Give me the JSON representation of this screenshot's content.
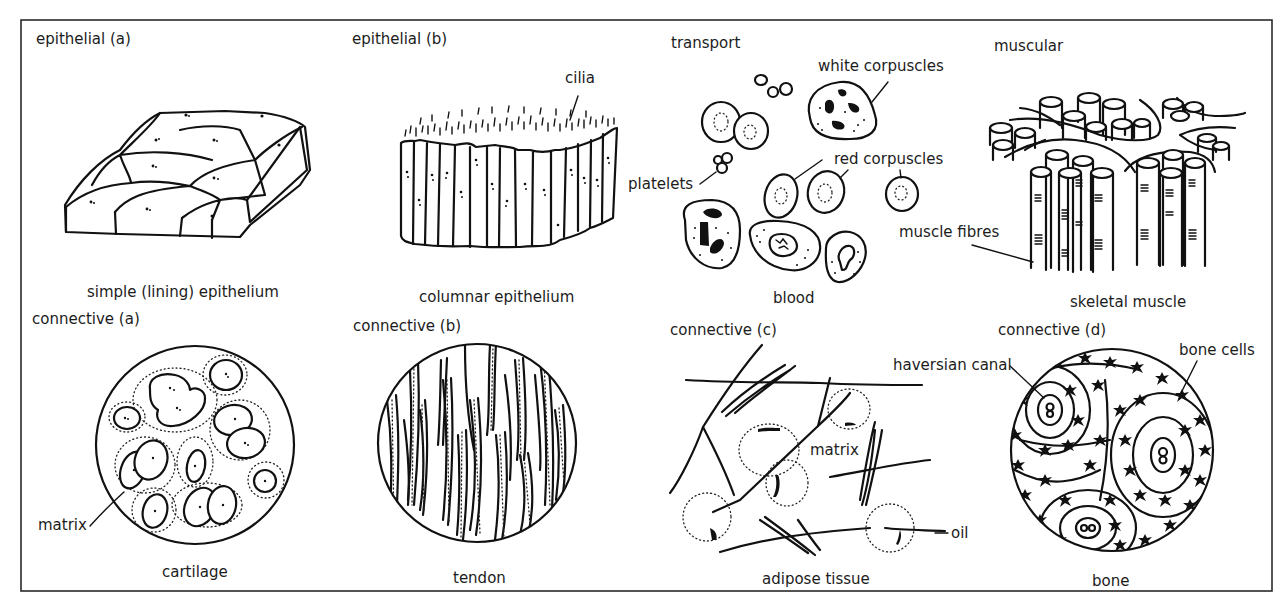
{
  "figure": {
    "panels": [
      {
        "id": "epithelial-a",
        "category": "epithelial (a)",
        "caption": "simple (lining) epithelium",
        "labels": []
      },
      {
        "id": "epithelial-b",
        "category": "epithelial (b)",
        "caption": "columnar epithelium",
        "labels": [
          "cilia"
        ]
      },
      {
        "id": "transport",
        "category": "transport",
        "caption": "blood",
        "labels": [
          "white corpuscles",
          "red corpuscles",
          "platelets"
        ]
      },
      {
        "id": "muscular",
        "category": "muscular",
        "caption": "skeletal muscle",
        "labels": [
          "muscle fibres"
        ]
      },
      {
        "id": "connective-a",
        "category": "connective (a)",
        "caption": "cartilage",
        "labels": [
          "matrix"
        ]
      },
      {
        "id": "connective-b",
        "category": "connective (b)",
        "caption": "tendon",
        "labels": []
      },
      {
        "id": "connective-c",
        "category": "connective (c)",
        "caption": "adipose tissue",
        "labels": [
          "matrix",
          "oil"
        ]
      },
      {
        "id": "connective-d",
        "category": "connective (d)",
        "caption": "bone",
        "labels": [
          "haversian canal",
          "bone cells"
        ]
      }
    ]
  }
}
